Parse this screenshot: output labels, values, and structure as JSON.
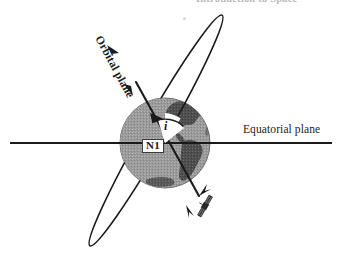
{
  "figure": {
    "title_partial": "Introduction to Space",
    "caption": "",
    "background_color": "#ffffff",
    "ink_color": "#1a1a1a"
  },
  "labels": {
    "equatorial_plane": "Equatorial plane",
    "orbital_plane": "Orbital plane",
    "ascending_node": "N1",
    "inclination_symbol": "i"
  },
  "colors": {
    "earth_fill": "#9a9a9a",
    "earth_land": "#4f4f4f",
    "earth_edge": "#6e6e6e",
    "line": "#1a1a1a",
    "wedge_fill": "#ffffff",
    "header_gray": "#b8b8bd"
  },
  "geometry": {
    "earth_center_x": 165,
    "earth_center_y": 143,
    "earth_radius": 45,
    "equator_y": 143,
    "equator_x_start": 10,
    "equator_x_end": 332,
    "orbit_top_x": 90,
    "orbit_top_y": 16,
    "orbit_bottom_x": 222,
    "orbit_bottom_y": 245,
    "orbit_angle_deg": 60,
    "inclination_angle_deg": 62
  },
  "icons": {
    "satellite": "satellite-icon",
    "direction_arrow": "arrow-icon"
  }
}
